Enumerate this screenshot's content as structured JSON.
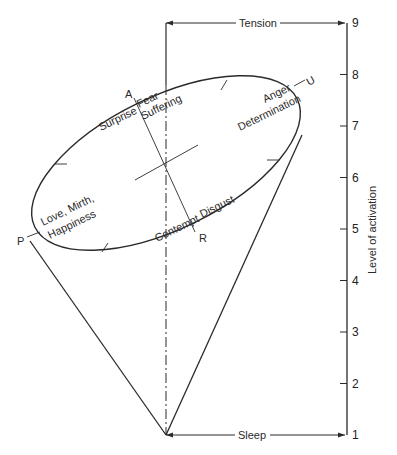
{
  "diagram": {
    "top_label": "Tension",
    "bottom_label": "Sleep",
    "axis_title": "Level of activation",
    "axis_ticks": [
      "1",
      "2",
      "3",
      "4",
      "5",
      "6",
      "7",
      "8",
      "9"
    ],
    "points": {
      "A": "A",
      "U": "U",
      "R": "R",
      "P": "P"
    },
    "emotions": {
      "surprise": "Surprise",
      "fear": "Fear",
      "suffering": "Suffering",
      "anger": "Anger",
      "determination": "Determination",
      "love": "Love, Mirth,",
      "happiness": "Happiness",
      "contempt": "Contempt",
      "disgust": "Disgust"
    }
  }
}
